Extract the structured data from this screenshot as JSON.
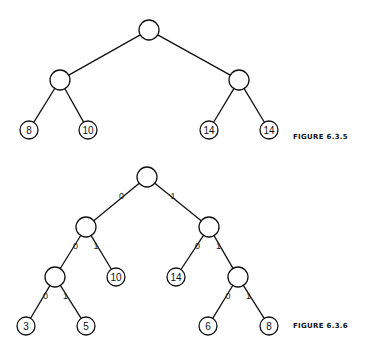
{
  "figures": [
    {
      "caption": "FIGURE 6.3.5",
      "caption_pos": [
        293,
        133
      ],
      "nodes": [
        {
          "id": "r",
          "x": 149,
          "y": 30,
          "r": 10,
          "label": ""
        },
        {
          "id": "a",
          "x": 60,
          "y": 80,
          "r": 10,
          "label": ""
        },
        {
          "id": "b",
          "x": 239,
          "y": 80,
          "r": 10,
          "label": ""
        },
        {
          "id": "c",
          "x": 29,
          "y": 130,
          "r": 9,
          "label": "8"
        },
        {
          "id": "d",
          "x": 88,
          "y": 130,
          "r": 9,
          "label": "10"
        },
        {
          "id": "e",
          "x": 209,
          "y": 130,
          "r": 9,
          "label": "14"
        },
        {
          "id": "f",
          "x": 269,
          "y": 130,
          "r": 9,
          "label": "14"
        }
      ],
      "edges": [
        {
          "from": "r",
          "to": "a",
          "label": ""
        },
        {
          "from": "r",
          "to": "b",
          "label": ""
        },
        {
          "from": "a",
          "to": "c",
          "label": ""
        },
        {
          "from": "a",
          "to": "d",
          "label": ""
        },
        {
          "from": "b",
          "to": "e",
          "label": ""
        },
        {
          "from": "b",
          "to": "f",
          "label": ""
        }
      ]
    },
    {
      "caption": "FIGURE 6.3.6",
      "caption_pos": [
        293,
        322
      ],
      "nodes": [
        {
          "id": "r",
          "x": 147,
          "y": 177,
          "r": 10,
          "label": ""
        },
        {
          "id": "a",
          "x": 86,
          "y": 227,
          "r": 10,
          "label": ""
        },
        {
          "id": "b",
          "x": 209,
          "y": 227,
          "r": 10,
          "label": ""
        },
        {
          "id": "c",
          "x": 55,
          "y": 277,
          "r": 10,
          "label": ""
        },
        {
          "id": "d",
          "x": 116,
          "y": 277,
          "r": 9,
          "label": "10"
        },
        {
          "id": "e",
          "x": 176,
          "y": 277,
          "r": 9,
          "label": "14"
        },
        {
          "id": "f",
          "x": 238,
          "y": 277,
          "r": 10,
          "label": ""
        },
        {
          "id": "g",
          "x": 26,
          "y": 326,
          "r": 9,
          "label": "3"
        },
        {
          "id": "h",
          "x": 86,
          "y": 326,
          "r": 9,
          "label": "5"
        },
        {
          "id": "i",
          "x": 208,
          "y": 326,
          "r": 9,
          "label": "6"
        },
        {
          "id": "j",
          "x": 269,
          "y": 326,
          "r": 9,
          "label": "8"
        }
      ],
      "edges": [
        {
          "from": "r",
          "to": "a",
          "label": "0"
        },
        {
          "from": "r",
          "to": "b",
          "label": "1"
        },
        {
          "from": "a",
          "to": "c",
          "label": "0"
        },
        {
          "from": "a",
          "to": "d",
          "label": "1"
        },
        {
          "from": "b",
          "to": "e",
          "label": "0"
        },
        {
          "from": "b",
          "to": "f",
          "label": "1"
        },
        {
          "from": "c",
          "to": "g",
          "label": "0"
        },
        {
          "from": "c",
          "to": "h",
          "label": "1"
        },
        {
          "from": "f",
          "to": "i",
          "label": "0"
        },
        {
          "from": "f",
          "to": "j",
          "label": "1"
        }
      ]
    }
  ]
}
